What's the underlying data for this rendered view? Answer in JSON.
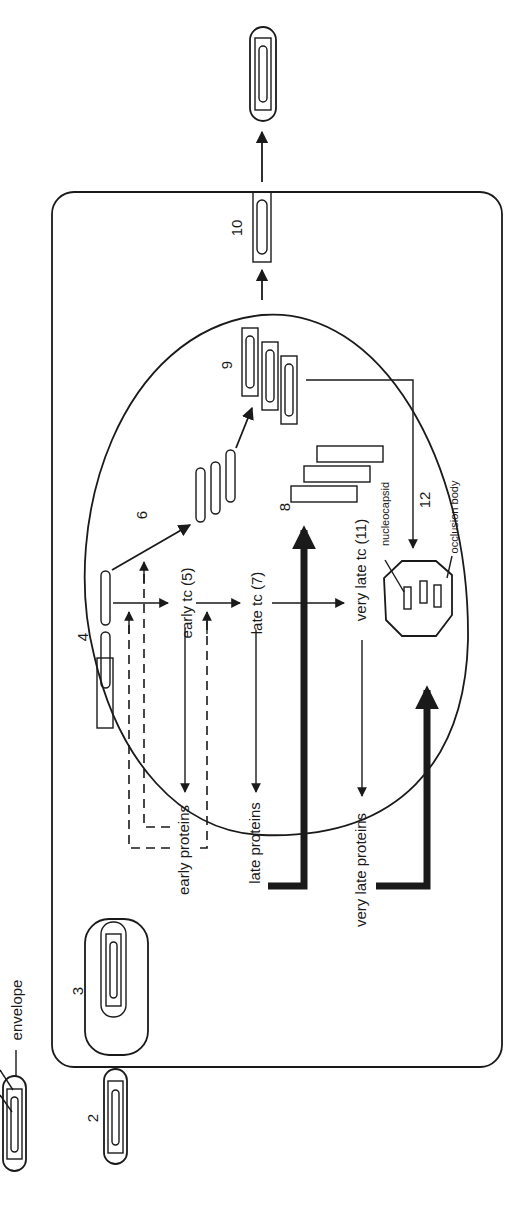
{
  "diagram": {
    "orientation": "rotated 90 degrees counter-clockwise",
    "colors": {
      "ink": "#1a1a1a",
      "background": "#ffffff"
    },
    "labels": {
      "envelope": "envelope",
      "early_tc": "early tc (5)",
      "late_tc": "late tc (7)",
      "very_late_tc": "very late tc (11)",
      "early_proteins": "early proteins",
      "late_proteins": "late proteins",
      "very_late_proteins": "very late proteins",
      "nucleocapsid": "nucleocapsid",
      "occlusion_body": "occlusion body"
    },
    "steps": {
      "s2": "2",
      "s3": "3",
      "s4": "4",
      "s6": "6",
      "s8": "8",
      "s9": "9",
      "s10": "10",
      "s12": "12"
    }
  }
}
